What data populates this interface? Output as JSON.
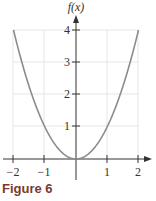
{
  "chart_data": {
    "type": "line",
    "title": "",
    "caption": "Figure 6",
    "xlabel": "",
    "ylabel": "f(x)",
    "function": "f(x) = x^2",
    "x": [
      -2,
      -1.5,
      -1,
      -0.5,
      0,
      0.5,
      1,
      1.5,
      2
    ],
    "series": [
      {
        "name": "f(x)",
        "values": [
          4,
          2.25,
          1,
          0.25,
          0,
          0.25,
          1,
          2.25,
          4
        ]
      }
    ],
    "xticks": [
      "-2",
      "-1",
      "1",
      "2"
    ],
    "yticks": [
      "1",
      "2",
      "3",
      "4"
    ],
    "xlim": [
      -2,
      2
    ],
    "ylim": [
      0,
      4
    ],
    "grid": true,
    "line_color": "#8c8c8c"
  },
  "figure": {
    "caption": "Figure 6",
    "ylabel": "f(x)",
    "xtick_labels": [
      "−2",
      "−1",
      "1",
      "2"
    ],
    "ytick_labels": [
      "1",
      "2",
      "3",
      "4"
    ]
  }
}
